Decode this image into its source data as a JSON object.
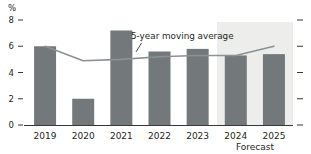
{
  "chart_data": {
    "type": "bar",
    "title": "",
    "subtitle": "",
    "xlabel": "",
    "ylabel": "",
    "unit_label": "%",
    "categories": [
      "2019",
      "2020",
      "2021",
      "2022",
      "2023",
      "2024",
      "2025"
    ],
    "values": [
      6.0,
      2.0,
      7.2,
      5.6,
      5.8,
      5.3,
      5.4
    ],
    "series": [
      {
        "name": "5-year moving average",
        "type": "line",
        "values": [
          6.0,
          4.9,
          5.0,
          5.2,
          5.3,
          5.3,
          6.0
        ]
      }
    ],
    "ylim": [
      0,
      8
    ],
    "yticks": [
      0,
      2,
      4,
      6,
      8
    ],
    "ytick_labels": [
      "0",
      "2",
      "4",
      "6",
      "8"
    ],
    "grid": false,
    "legend": "none",
    "annotations": [
      {
        "text": "5-year moving average",
        "target_series": "5-year moving average"
      },
      {
        "text": "Forecast",
        "region_start_category": "2024",
        "region_end_category": "2025"
      }
    ],
    "colors": {
      "bar": "#73787a",
      "line": "#8b9194",
      "forecast_band": "#ededec",
      "axis": "#231f20",
      "text": "#231f20"
    }
  }
}
